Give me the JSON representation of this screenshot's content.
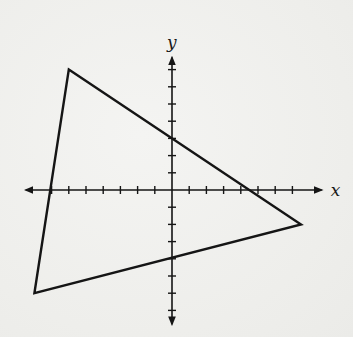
{
  "figure": {
    "axes": {
      "x_label": "x",
      "y_label": "y",
      "tick_unit_px": 17.2,
      "origin_px": [
        172,
        190
      ],
      "x_ticks": [
        -7,
        -6,
        -5,
        -4,
        -3,
        -2,
        -1,
        1,
        2,
        3,
        4,
        5,
        6,
        7
      ],
      "y_ticks": [
        -7,
        -6,
        -5,
        -4,
        -3,
        -2,
        -1,
        1,
        2,
        3,
        4,
        5,
        6,
        7
      ],
      "x_range": [
        -8.5,
        8.7
      ],
      "y_range": [
        -7.8,
        7.7
      ],
      "arrows": true,
      "tick_labels_shown": false
    },
    "triangle": {
      "vertices": [
        {
          "name": "top-left",
          "x": -6,
          "y": 7
        },
        {
          "name": "right",
          "x": 7.5,
          "y": -2
        },
        {
          "name": "bottom-left",
          "x": -8,
          "y": -6
        }
      ],
      "stroke_color": "#151515",
      "fill": "none"
    },
    "colors": {
      "background": "#f1f1ef",
      "ink": "#151515"
    }
  }
}
